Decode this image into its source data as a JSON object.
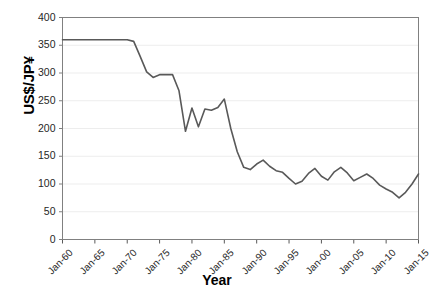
{
  "chart_data": {
    "type": "line",
    "title": "",
    "xlabel": "Year",
    "ylabel": "US$/JP¥",
    "ylim": [
      0,
      400
    ],
    "ytick_step": 50,
    "yticks": [
      "0",
      "50",
      "100",
      "150",
      "200",
      "250",
      "300",
      "350",
      "400"
    ],
    "xticks": [
      "Jan-60",
      "Jan-65",
      "Jan-70",
      "Jan-75",
      "Jan-80",
      "Jan-85",
      "Jan-90",
      "Jan-95",
      "Jan-00",
      "Jan-05",
      "Jan-10",
      "Jan-15"
    ],
    "xlim": [
      1960,
      2015
    ],
    "grid": "horizontal",
    "legend": "none",
    "line_color": "#595959",
    "series": [
      {
        "name": "US$/JP¥",
        "x": [
          1960,
          1961,
          1962,
          1963,
          1964,
          1965,
          1966,
          1967,
          1968,
          1969,
          1970,
          1971,
          1972,
          1973,
          1974,
          1975,
          1976,
          1977,
          1978,
          1979,
          1980,
          1981,
          1982,
          1983,
          1984,
          1985,
          1986,
          1987,
          1988,
          1989,
          1990,
          1991,
          1992,
          1993,
          1994,
          1995,
          1996,
          1997,
          1998,
          1999,
          2000,
          2001,
          2002,
          2003,
          2004,
          2005,
          2006,
          2007,
          2008,
          2009,
          2010,
          2011,
          2012,
          2013,
          2014,
          2015
        ],
        "values": [
          360,
          360,
          360,
          360,
          360,
          360,
          360,
          360,
          360,
          360,
          360,
          357,
          330,
          302,
          292,
          297,
          297,
          297,
          268,
          195,
          237,
          203,
          235,
          233,
          238,
          253,
          200,
          158,
          130,
          126,
          136,
          143,
          132,
          124,
          121,
          110,
          100,
          105,
          119,
          128,
          114,
          107,
          122,
          130,
          120,
          106,
          112,
          118,
          110,
          98,
          91,
          85,
          75,
          85,
          100,
          118
        ]
      }
    ]
  },
  "axes": {
    "ylabel_text": "US$/JP¥",
    "xlabel_text": "Year"
  }
}
